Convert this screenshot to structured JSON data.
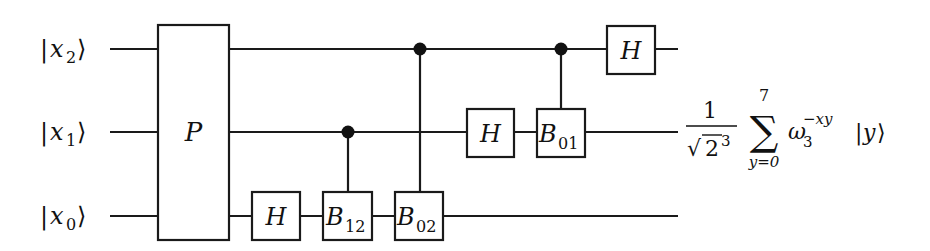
{
  "diagram": {
    "type": "quantum-circuit",
    "inputs": [
      {
        "id": "x2",
        "ket_open": "|",
        "symbol": "x",
        "subscript": "2",
        "ket_close": "⟩"
      },
      {
        "id": "x1",
        "ket_open": "|",
        "symbol": "x",
        "subscript": "1",
        "ket_close": "⟩"
      },
      {
        "id": "x0",
        "ket_open": "|",
        "symbol": "x",
        "subscript": "0",
        "ket_close": "⟩"
      }
    ],
    "gates": [
      {
        "id": "P",
        "label": "P",
        "subscript": "",
        "targets": [
          "x2",
          "x1",
          "x0"
        ],
        "control": null
      },
      {
        "id": "H_x0",
        "label": "H",
        "subscript": "",
        "targets": [
          "x0"
        ],
        "control": null
      },
      {
        "id": "B12",
        "label": "B",
        "subscript": "12",
        "targets": [
          "x0"
        ],
        "control": "x1"
      },
      {
        "id": "B02",
        "label": "B",
        "subscript": "02",
        "targets": [
          "x0"
        ],
        "control": "x2"
      },
      {
        "id": "H_x1",
        "label": "H",
        "subscript": "",
        "targets": [
          "x1"
        ],
        "control": null
      },
      {
        "id": "B01",
        "label": "B",
        "subscript": "01",
        "targets": [
          "x1"
        ],
        "control": "x2"
      },
      {
        "id": "H_x2",
        "label": "H",
        "subscript": "",
        "targets": [
          "x2"
        ],
        "control": null
      }
    ],
    "output": {
      "numerator": "1",
      "sqrt_symbol": "√",
      "sqrt_base": "2",
      "sqrt_exponent": "3",
      "sum_symbol": "∑",
      "sum_upper": "7",
      "sum_lower": "y=0",
      "omega": "ω",
      "omega_subscript": "3",
      "omega_exponent": "−xy",
      "ket_open": "|",
      "ket_symbol": "y",
      "ket_close": "⟩"
    },
    "colors": {
      "line": "#1a1a1a",
      "background": "#ffffff",
      "control_dot": "#111111"
    }
  }
}
